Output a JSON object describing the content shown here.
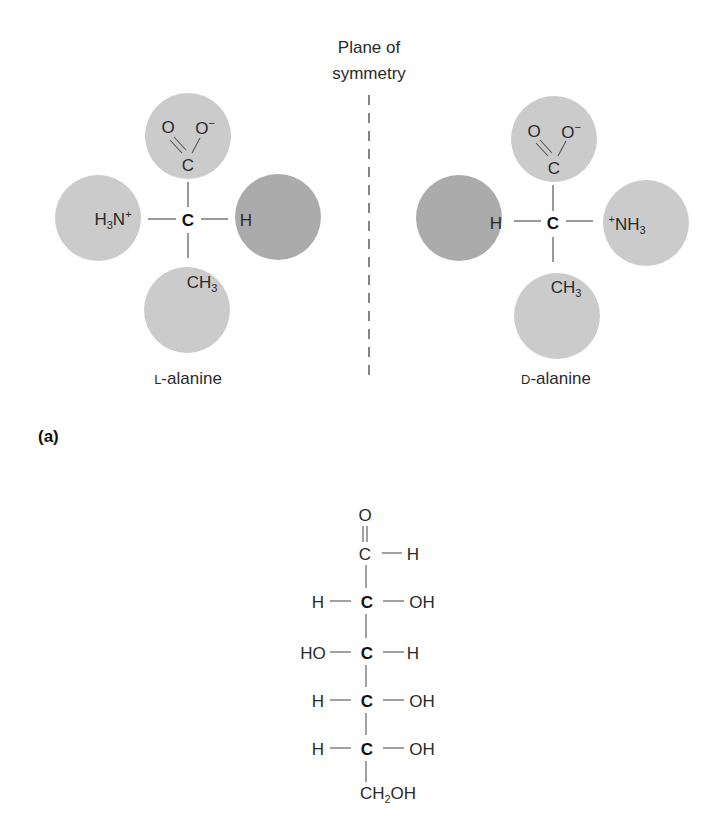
{
  "figure": {
    "panel_a": {
      "label": "(a)",
      "plane_label_line1": "Plane of",
      "plane_label_line2": "symmetry",
      "l_alanine": {
        "name": "L-alanine",
        "center_atom": "C",
        "top_group": {
          "o_double": "O",
          "o_minus": "O",
          "o_charge": "−",
          "carbon": "C"
        },
        "left_group": {
          "h": "H",
          "sub": "3",
          "n": "N",
          "charge": "+"
        },
        "right_group": {
          "text": "H"
        },
        "bottom_group": {
          "ch": "CH",
          "sub": "3"
        }
      },
      "d_alanine": {
        "name": "D-alanine",
        "center_atom": "C",
        "top_group": {
          "o_double": "O",
          "o_minus": "O",
          "o_charge": "−",
          "carbon": "C"
        },
        "left_group": {
          "text": "H"
        },
        "right_group": {
          "charge": "+",
          "nh": "NH",
          "sub": "3"
        },
        "bottom_group": {
          "ch": "CH",
          "sub": "3"
        }
      },
      "colors": {
        "light_sphere": "#c9c9c9",
        "dark_sphere": "#a9a9a9",
        "line": "#555555"
      }
    },
    "panel_b": {
      "aldehyde_o": "O",
      "aldehyde_c": "C",
      "aldehyde_h": "H",
      "rows": [
        {
          "left": "H",
          "center": "C",
          "right": "OH"
        },
        {
          "left": "HO",
          "center": "C",
          "right": "H"
        },
        {
          "left": "H",
          "center": "C",
          "right": "OH"
        },
        {
          "left": "H",
          "center": "C",
          "right": "OH"
        }
      ],
      "terminal": {
        "ch": "CH",
        "sub": "2",
        "oh": "OH"
      }
    }
  }
}
